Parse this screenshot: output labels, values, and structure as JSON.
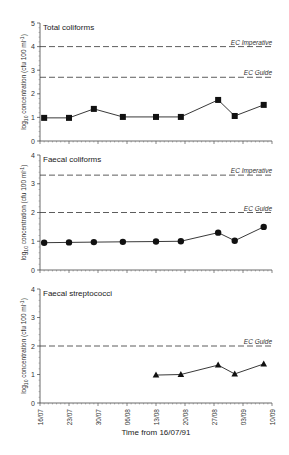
{
  "chart_data": [
    {
      "type": "line",
      "title": "Total coliforms",
      "ylabel": "log10 concentration (cfu 100 ml-1)",
      "ylim": [
        0,
        5
      ],
      "yticks": [
        0,
        1,
        2,
        3,
        4,
        5
      ],
      "marker": "square",
      "x_days": [
        1,
        7,
        13,
        20,
        28,
        34,
        43,
        47,
        54
      ],
      "values": [
        0.98,
        0.98,
        1.36,
        1.02,
        1.02,
        1.02,
        1.74,
        1.06,
        1.53
      ],
      "reference_lines": [
        {
          "label": "EC Imperative",
          "value": 4.0
        },
        {
          "label": "EC Guide",
          "value": 2.7
        }
      ]
    },
    {
      "type": "line",
      "title": "Faecal coliforms",
      "ylabel": "log10 concentration (cfu 100 ml-1)",
      "ylim": [
        0,
        4
      ],
      "yticks": [
        0,
        1,
        2,
        3,
        4
      ],
      "marker": "circle",
      "x_days": [
        1,
        7,
        13,
        20,
        28,
        34,
        43,
        47,
        54
      ],
      "values": [
        0.95,
        0.96,
        0.97,
        0.98,
        0.99,
        1.0,
        1.3,
        1.02,
        1.5
      ],
      "reference_lines": [
        {
          "label": "EC Imperative",
          "value": 3.3
        },
        {
          "label": "EC Guide",
          "value": 2.0
        }
      ]
    },
    {
      "type": "line",
      "title": "Faecal streptococci",
      "ylabel": "log10 concentration (cfu 100 ml-1)",
      "ylim": [
        0,
        4
      ],
      "yticks": [
        0,
        1,
        2,
        3,
        4
      ],
      "marker": "triangle",
      "x_days": [
        28,
        34,
        43,
        47,
        54
      ],
      "values": [
        0.98,
        1.0,
        1.33,
        1.02,
        1.37
      ],
      "reference_lines": [
        {
          "label": "EC Guide",
          "value": 2.0
        }
      ],
      "xlabel": "Time from 16/07/91",
      "xtick_labels": [
        "16/07",
        "23/07",
        "30/07",
        "06/08",
        "13/08",
        "20/08",
        "27/08",
        "03/09",
        "10/09"
      ],
      "xlim_days": [
        0,
        56
      ]
    }
  ],
  "labels": {
    "ylabel_main": "log",
    "ylabel_sub": "10",
    "ylabel_rest": " concentration (cfu 100 ml",
    "ylabel_sup": "-1",
    "ylabel_close": ")",
    "xlabel": "Time from 16/07/91"
  }
}
